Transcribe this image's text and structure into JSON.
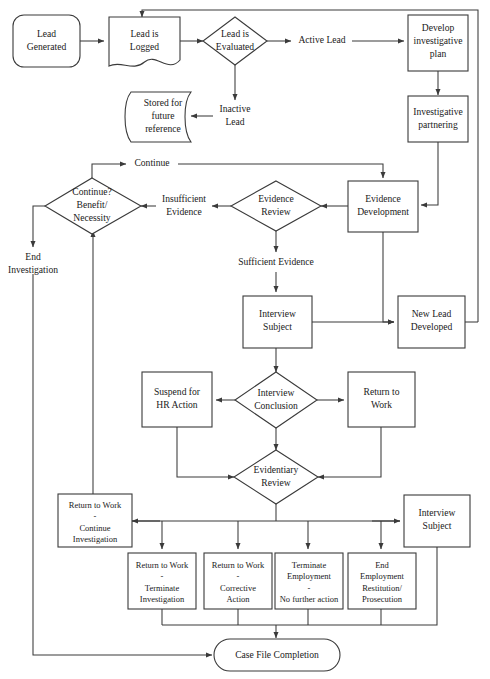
{
  "diagram": {
    "stroke_color": "#3a3a3a",
    "text_color": "#1a1a1a",
    "background": "#ffffff"
  },
  "nodes": {
    "lead_generated": {
      "label_1": "Lead",
      "label_2": "Generated",
      "shape": "terminator"
    },
    "lead_is_logged": {
      "label_1": "Lead is",
      "label_2": "Logged",
      "shape": "document"
    },
    "lead_is_evaluated": {
      "label_1": "Lead is",
      "label_2": "Evaluated",
      "shape": "decision"
    },
    "active_lead": {
      "label": "Active Lead",
      "shape": "text"
    },
    "develop_investigative_plan": {
      "label_1": "Develop",
      "label_2": "investigative",
      "label_3": "plan",
      "shape": "process"
    },
    "investigative_partnering": {
      "label_1": "Investigative",
      "label_2": "partnering",
      "shape": "process"
    },
    "inactive_lead": {
      "label_1": "Inactive",
      "label_2": "Lead",
      "shape": "text"
    },
    "stored_for_future_reference": {
      "label_1": "Stored for",
      "label_2": "future",
      "label_3": "reference",
      "shape": "stored-data"
    },
    "continue_label": {
      "label": "Continue",
      "shape": "edge-label"
    },
    "continue_benefit_necessity": {
      "label_1": "Continue?",
      "label_2": "Benefit/",
      "label_3": "Necessity",
      "shape": "decision"
    },
    "insufficient_evidence": {
      "label_1": "Insufficient",
      "label_2": "Evidence",
      "shape": "edge-label"
    },
    "evidence_review": {
      "label_1": "Evidence",
      "label_2": "Review",
      "shape": "decision"
    },
    "evidence_development": {
      "label_1": "Evidence",
      "label_2": "Development",
      "shape": "process"
    },
    "end_investigation": {
      "label_1": "End",
      "label_2": "Investigation",
      "shape": "edge-label"
    },
    "sufficient_evidence": {
      "label": "Sufficient Evidence",
      "shape": "edge-label"
    },
    "interview_subject_upper": {
      "label_1": "Interview",
      "label_2": "Subject",
      "shape": "process"
    },
    "new_lead_developed": {
      "label_1": "New Lead",
      "label_2": "Developed",
      "shape": "process"
    },
    "suspend_for_hr_action": {
      "label_1": "Suspend for",
      "label_2": "HR Action",
      "shape": "process"
    },
    "interview_conclusion": {
      "label_1": "Interview",
      "label_2": "Conclusion",
      "shape": "decision"
    },
    "return_to_work": {
      "label_1": "Return to",
      "label_2": "Work",
      "shape": "process"
    },
    "evidentiary_review": {
      "label_1": "Evidentiary",
      "label_2": "Review",
      "shape": "decision"
    },
    "return_to_work_continue_investigation": {
      "label_1": "Return to Work",
      "label_2": "-",
      "label_3": "Continue",
      "label_4": "Investigation",
      "shape": "process"
    },
    "interview_subject_lower": {
      "label_1": "Interview",
      "label_2": "Subject",
      "shape": "process"
    },
    "return_to_work_terminate_investigation": {
      "label_1": "Return to Work",
      "label_2": "-",
      "label_3": "Terminate",
      "label_4": "Investigation",
      "shape": "process"
    },
    "return_to_work_corrective_action": {
      "label_1": "Return to Work",
      "label_2": "-",
      "label_3": "Corrective",
      "label_4": "Action",
      "shape": "process"
    },
    "terminate_employment": {
      "label_1": "Terminate",
      "label_2": "Employment",
      "label_3": "-",
      "label_4": "No further action",
      "shape": "process"
    },
    "end_employment_restitution_prosecution": {
      "label_1": "End",
      "label_2": "Employment",
      "label_3": "Restitution/",
      "label_4": "Prosecution",
      "shape": "process"
    },
    "case_file_completion": {
      "label": "Case File Completion",
      "shape": "terminator"
    }
  }
}
